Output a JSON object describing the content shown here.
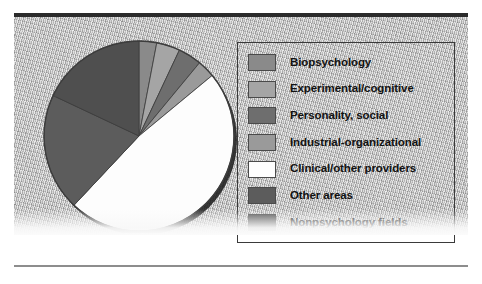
{
  "figure": {
    "background_color": "#b9b9b9",
    "rule_top_color": "#2b2b2b",
    "rule_bottom_color": "#8d8d8d"
  },
  "legend": {
    "border_color": "#3a3a3a",
    "items": [
      {
        "label": "Biopsychology",
        "color": "#8a8a8a"
      },
      {
        "label": "Experimental/cognitive",
        "color": "#a5a5a5"
      },
      {
        "label": "Personality, social",
        "color": "#6e6e6e"
      },
      {
        "label": "Industrial-organizational",
        "color": "#9a9a9a"
      },
      {
        "label": "Clinical/other providers",
        "color": "#fdfdfd"
      },
      {
        "label": "Other areas",
        "color": "#5c5c5c"
      },
      {
        "label": "Nonpsychology fields",
        "color": "#4f4f4f"
      }
    ]
  },
  "chart_data": {
    "type": "pie",
    "title": "",
    "legend_position": "right",
    "labels": [
      "Biopsychology",
      "Experimental/cognitive",
      "Personality, social",
      "Industrial-organizational",
      "Clinical/other providers",
      "Other areas",
      "Nonpsychology fields"
    ],
    "values": [
      3,
      4,
      4,
      3,
      48,
      20,
      18
    ],
    "colors": [
      "#8a8a8a",
      "#a5a5a5",
      "#6e6e6e",
      "#9a9a9a",
      "#fdfdfd",
      "#5c5c5c",
      "#4f4f4f"
    ],
    "start_angle_deg": 0,
    "direction": "clockwise",
    "edge_color": "#3d3d3d",
    "shadow": true
  }
}
